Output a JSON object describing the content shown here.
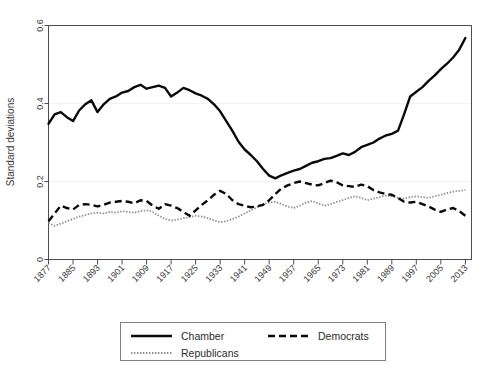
{
  "chart_data": {
    "type": "line",
    "title": "",
    "subtitle": "",
    "xlabel": "",
    "ylabel": "Standard deviations",
    "xlim": [
      1877,
      2015
    ],
    "ylim": [
      0,
      0.6
    ],
    "grid": true,
    "grid_axis": "y",
    "legend_position": "bottom",
    "y_ticks": [
      "0",
      "0.2",
      "0.4",
      "0.6"
    ],
    "y_tick_values": [
      0,
      0.2,
      0.4,
      0.6
    ],
    "x_ticks": [
      "1877",
      "1885",
      "1893",
      "1901",
      "1909",
      "1917",
      "1925",
      "1933",
      "1941",
      "1949",
      "1957",
      "1965",
      "1973",
      "1981",
      "1989",
      "1997",
      "2005",
      "2013"
    ],
    "x_tick_values": [
      1877,
      1885,
      1893,
      1901,
      1909,
      1917,
      1925,
      1933,
      1941,
      1949,
      1957,
      1965,
      1973,
      1981,
      1989,
      1997,
      2005,
      2013
    ],
    "x": [
      1877,
      1879,
      1881,
      1883,
      1885,
      1887,
      1889,
      1891,
      1893,
      1895,
      1897,
      1899,
      1901,
      1903,
      1905,
      1907,
      1909,
      1911,
      1913,
      1915,
      1917,
      1919,
      1921,
      1923,
      1925,
      1927,
      1929,
      1931,
      1933,
      1935,
      1937,
      1939,
      1941,
      1943,
      1945,
      1947,
      1949,
      1951,
      1953,
      1955,
      1957,
      1959,
      1961,
      1963,
      1965,
      1967,
      1969,
      1971,
      1973,
      1975,
      1977,
      1979,
      1981,
      1983,
      1985,
      1987,
      1989,
      1991,
      1993,
      1995,
      1997,
      1999,
      2001,
      2003,
      2005,
      2007,
      2009,
      2011,
      2013
    ],
    "series": [
      {
        "name": "Chamber",
        "style": "solid",
        "color": "#0a0a0a",
        "values": [
          0.348,
          0.372,
          0.378,
          0.365,
          0.355,
          0.382,
          0.398,
          0.408,
          0.378,
          0.398,
          0.412,
          0.418,
          0.428,
          0.432,
          0.442,
          0.448,
          0.438,
          0.442,
          0.446,
          0.44,
          0.418,
          0.428,
          0.44,
          0.434,
          0.426,
          0.42,
          0.412,
          0.398,
          0.38,
          0.355,
          0.33,
          0.302,
          0.282,
          0.268,
          0.252,
          0.232,
          0.215,
          0.208,
          0.216,
          0.222,
          0.228,
          0.232,
          0.24,
          0.248,
          0.252,
          0.258,
          0.26,
          0.266,
          0.272,
          0.268,
          0.276,
          0.288,
          0.294,
          0.3,
          0.31,
          0.318,
          0.322,
          0.33,
          0.372,
          0.418,
          0.43,
          0.442,
          0.458,
          0.472,
          0.488,
          0.502,
          0.518,
          0.538,
          0.568
        ]
      },
      {
        "name": "Democrats",
        "style": "dashed",
        "color": "#0a0a0a",
        "values": [
          0.098,
          0.118,
          0.138,
          0.132,
          0.128,
          0.14,
          0.142,
          0.14,
          0.136,
          0.14,
          0.146,
          0.148,
          0.15,
          0.148,
          0.144,
          0.152,
          0.15,
          0.138,
          0.13,
          0.142,
          0.138,
          0.132,
          0.122,
          0.112,
          0.126,
          0.14,
          0.152,
          0.166,
          0.176,
          0.168,
          0.152,
          0.142,
          0.138,
          0.134,
          0.136,
          0.14,
          0.152,
          0.168,
          0.182,
          0.19,
          0.196,
          0.2,
          0.196,
          0.192,
          0.19,
          0.196,
          0.202,
          0.198,
          0.19,
          0.188,
          0.186,
          0.192,
          0.188,
          0.178,
          0.172,
          0.168,
          0.166,
          0.158,
          0.148,
          0.146,
          0.148,
          0.142,
          0.136,
          0.128,
          0.122,
          0.128,
          0.132,
          0.124,
          0.112
        ]
      },
      {
        "name": "Republicans",
        "style": "dotted",
        "color": "#8c8c8c",
        "values": [
          0.094,
          0.086,
          0.092,
          0.098,
          0.104,
          0.11,
          0.114,
          0.118,
          0.12,
          0.118,
          0.122,
          0.12,
          0.124,
          0.122,
          0.12,
          0.124,
          0.126,
          0.122,
          0.112,
          0.104,
          0.1,
          0.102,
          0.106,
          0.108,
          0.112,
          0.11,
          0.106,
          0.1,
          0.096,
          0.098,
          0.104,
          0.11,
          0.118,
          0.126,
          0.134,
          0.142,
          0.146,
          0.148,
          0.142,
          0.136,
          0.132,
          0.138,
          0.146,
          0.15,
          0.144,
          0.138,
          0.142,
          0.148,
          0.152,
          0.158,
          0.162,
          0.158,
          0.152,
          0.156,
          0.16,
          0.164,
          0.162,
          0.158,
          0.156,
          0.16,
          0.162,
          0.16,
          0.158,
          0.162,
          0.166,
          0.17,
          0.174,
          0.176,
          0.178
        ]
      }
    ]
  },
  "axes": {
    "y_title": "Standard deviations"
  },
  "legend": {
    "entries": [
      {
        "label": "Chamber",
        "style": "solid"
      },
      {
        "label": "Democrats",
        "style": "dashed"
      },
      {
        "label": "Republicans",
        "style": "dotted"
      }
    ]
  }
}
